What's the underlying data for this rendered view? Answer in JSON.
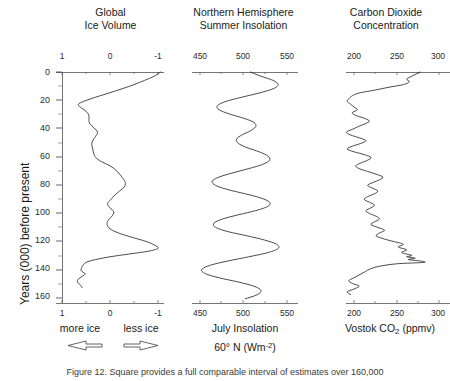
{
  "figure": {
    "caption": "Figure 12. Square provides a full comparable interval of estimates over 160,000"
  },
  "yaxis": {
    "label": "Years (000) before present",
    "ticks": [
      "0",
      "20",
      "40",
      "60",
      "80",
      "100",
      "120",
      "140",
      "160"
    ],
    "min": 0,
    "max": 165,
    "inverted": true
  },
  "panels": [
    {
      "id": "ice-volume",
      "title_line1": "Global",
      "title_line2": "Ice Volume",
      "ticks": [
        "1",
        "0",
        "-1"
      ],
      "tick_values": [
        1,
        0,
        -1
      ],
      "xmin": 1.35,
      "xmax": -1.35,
      "caption_left": "more ice",
      "caption_right": "less ice",
      "arrow_left": "arrow-left",
      "arrow_right": "arrow-right"
    },
    {
      "id": "insolation",
      "title_line1": "Northern Hemisphere",
      "title_line2": "Summer Insolation",
      "ticks": [
        "450",
        "500",
        "550"
      ],
      "tick_values": [
        450,
        500,
        550
      ],
      "xmin": 428,
      "xmax": 572,
      "caption_line1": "July Insolation",
      "caption_line2_pre": "60° N (Wm",
      "caption_line2_sup": "-2",
      "caption_line2_post": ")"
    },
    {
      "id": "co2",
      "title_line1": "Carbon Dioxide",
      "title_line2": "Concentration",
      "ticks": [
        "200",
        "250",
        "300"
      ],
      "tick_values": [
        200,
        250,
        300
      ],
      "xmin": 179,
      "xmax": 321,
      "caption_pre": "Vostok CO",
      "caption_sub": "2",
      "caption_post": " (ppmv)"
    }
  ],
  "chart_data": {
    "type": "line",
    "layout": "three horizontal panels sharing one inverted vertical time axis",
    "ylabel": "Years (000) before present",
    "ylim": [
      165,
      0
    ],
    "yticks": [
      0,
      20,
      40,
      60,
      80,
      100,
      120,
      140,
      160
    ],
    "grid": false,
    "legend": false,
    "series": [
      {
        "name": "Global Ice Volume",
        "panel": 0,
        "xlabel": "more ice  ←   →  less ice",
        "xlim": [
          1.35,
          -1.35
        ],
        "xticks": [
          1,
          0,
          -1
        ],
        "units": "relative δ18O (per mil)",
        "axis_direction": "reversed (1 at left, -1 at right)",
        "points": [
          {
            "age": 0,
            "value": -1.05
          },
          {
            "age": 3,
            "value": -0.92
          },
          {
            "age": 6,
            "value": -0.72
          },
          {
            "age": 9,
            "value": -0.5
          },
          {
            "age": 12,
            "value": -0.25
          },
          {
            "age": 15,
            "value": 0.02
          },
          {
            "age": 18,
            "value": 0.3
          },
          {
            "age": 21,
            "value": 0.55
          },
          {
            "age": 23,
            "value": 0.66
          },
          {
            "age": 25,
            "value": 0.62
          },
          {
            "age": 28,
            "value": 0.5
          },
          {
            "age": 31,
            "value": 0.44
          },
          {
            "age": 34,
            "value": 0.44
          },
          {
            "age": 37,
            "value": 0.42
          },
          {
            "age": 40,
            "value": 0.33
          },
          {
            "age": 43,
            "value": 0.26
          },
          {
            "age": 46,
            "value": 0.3
          },
          {
            "age": 49,
            "value": 0.36
          },
          {
            "age": 52,
            "value": 0.38
          },
          {
            "age": 55,
            "value": 0.36
          },
          {
            "age": 58,
            "value": 0.34
          },
          {
            "age": 61,
            "value": 0.3
          },
          {
            "age": 64,
            "value": 0.18
          },
          {
            "age": 67,
            "value": 0.0
          },
          {
            "age": 70,
            "value": -0.12
          },
          {
            "age": 73,
            "value": -0.2
          },
          {
            "age": 76,
            "value": -0.27
          },
          {
            "age": 79,
            "value": -0.32
          },
          {
            "age": 82,
            "value": -0.3
          },
          {
            "age": 85,
            "value": -0.2
          },
          {
            "age": 88,
            "value": -0.1
          },
          {
            "age": 91,
            "value": -0.02
          },
          {
            "age": 94,
            "value": 0.05
          },
          {
            "age": 97,
            "value": 0.0
          },
          {
            "age": 100,
            "value": -0.08
          },
          {
            "age": 103,
            "value": -0.04
          },
          {
            "age": 106,
            "value": 0.04
          },
          {
            "age": 109,
            "value": 0.06
          },
          {
            "age": 112,
            "value": 0.0
          },
          {
            "age": 115,
            "value": -0.18
          },
          {
            "age": 118,
            "value": -0.45
          },
          {
            "age": 121,
            "value": -0.75
          },
          {
            "age": 124,
            "value": -0.95
          },
          {
            "age": 126,
            "value": -1.0
          },
          {
            "age": 128,
            "value": -0.8
          },
          {
            "age": 130,
            "value": -0.4
          },
          {
            "age": 132,
            "value": 0.0
          },
          {
            "age": 134,
            "value": 0.3
          },
          {
            "age": 136,
            "value": 0.5
          },
          {
            "age": 139,
            "value": 0.58
          },
          {
            "age": 142,
            "value": 0.6
          },
          {
            "age": 144,
            "value": 0.52
          },
          {
            "age": 146,
            "value": 0.58
          },
          {
            "age": 148,
            "value": 0.66
          },
          {
            "age": 150,
            "value": 0.68
          },
          {
            "age": 152,
            "value": 0.62
          },
          {
            "age": 154,
            "value": 0.58
          }
        ]
      },
      {
        "name": "July Insolation 60° N",
        "panel": 1,
        "xlabel": "July Insolation 60° N (Wm-2)",
        "xlim": [
          428,
          572
        ],
        "xticks": [
          450,
          500,
          550
        ],
        "units": "Wm-2",
        "points": [
          {
            "age": 0,
            "value": 508
          },
          {
            "age": 3,
            "value": 520
          },
          {
            "age": 6,
            "value": 534
          },
          {
            "age": 9,
            "value": 540
          },
          {
            "age": 12,
            "value": 534
          },
          {
            "age": 15,
            "value": 518
          },
          {
            "age": 18,
            "value": 498
          },
          {
            "age": 21,
            "value": 480
          },
          {
            "age": 24,
            "value": 470
          },
          {
            "age": 27,
            "value": 472
          },
          {
            "age": 30,
            "value": 484
          },
          {
            "age": 33,
            "value": 500
          },
          {
            "age": 36,
            "value": 512
          },
          {
            "age": 39,
            "value": 514
          },
          {
            "age": 42,
            "value": 508
          },
          {
            "age": 45,
            "value": 498
          },
          {
            "age": 48,
            "value": 492
          },
          {
            "age": 51,
            "value": 494
          },
          {
            "age": 54,
            "value": 504
          },
          {
            "age": 57,
            "value": 518
          },
          {
            "age": 60,
            "value": 528
          },
          {
            "age": 63,
            "value": 530
          },
          {
            "age": 66,
            "value": 522
          },
          {
            "age": 69,
            "value": 506
          },
          {
            "age": 72,
            "value": 488
          },
          {
            "age": 75,
            "value": 472
          },
          {
            "age": 78,
            "value": 464
          },
          {
            "age": 81,
            "value": 468
          },
          {
            "age": 84,
            "value": 482
          },
          {
            "age": 87,
            "value": 502
          },
          {
            "age": 90,
            "value": 520
          },
          {
            "age": 93,
            "value": 530
          },
          {
            "age": 96,
            "value": 528
          },
          {
            "age": 99,
            "value": 514
          },
          {
            "age": 102,
            "value": 494
          },
          {
            "age": 105,
            "value": 476
          },
          {
            "age": 108,
            "value": 466
          },
          {
            "age": 111,
            "value": 468
          },
          {
            "age": 114,
            "value": 482
          },
          {
            "age": 117,
            "value": 504
          },
          {
            "age": 120,
            "value": 524
          },
          {
            "age": 123,
            "value": 538
          },
          {
            "age": 126,
            "value": 540
          },
          {
            "age": 129,
            "value": 528
          },
          {
            "age": 132,
            "value": 506
          },
          {
            "age": 135,
            "value": 482
          },
          {
            "age": 138,
            "value": 462
          },
          {
            "age": 141,
            "value": 452
          },
          {
            "age": 144,
            "value": 456
          },
          {
            "age": 147,
            "value": 472
          },
          {
            "age": 150,
            "value": 494
          },
          {
            "age": 153,
            "value": 512
          },
          {
            "age": 156,
            "value": 520
          },
          {
            "age": 159,
            "value": 516
          },
          {
            "age": 162,
            "value": 502
          }
        ]
      },
      {
        "name": "Vostok CO2",
        "panel": 2,
        "xlabel": "Vostok CO2 (ppmv)",
        "xlim": [
          179,
          321
        ],
        "xticks": [
          200,
          250,
          300
        ],
        "units": "ppmv",
        "points": [
          {
            "age": 0,
            "value": 278
          },
          {
            "age": 3,
            "value": 268
          },
          {
            "age": 5,
            "value": 262
          },
          {
            "age": 7,
            "value": 265
          },
          {
            "age": 9,
            "value": 258
          },
          {
            "age": 11,
            "value": 240
          },
          {
            "age": 13,
            "value": 224
          },
          {
            "age": 15,
            "value": 206
          },
          {
            "age": 17,
            "value": 198
          },
          {
            "age": 19,
            "value": 194
          },
          {
            "age": 21,
            "value": 192
          },
          {
            "age": 23,
            "value": 196
          },
          {
            "age": 25,
            "value": 200
          },
          {
            "age": 27,
            "value": 204
          },
          {
            "age": 29,
            "value": 198
          },
          {
            "age": 31,
            "value": 202
          },
          {
            "age": 33,
            "value": 212
          },
          {
            "age": 35,
            "value": 218
          },
          {
            "age": 37,
            "value": 213
          },
          {
            "age": 39,
            "value": 205
          },
          {
            "age": 41,
            "value": 198
          },
          {
            "age": 43,
            "value": 191
          },
          {
            "age": 45,
            "value": 196
          },
          {
            "age": 47,
            "value": 206
          },
          {
            "age": 49,
            "value": 214
          },
          {
            "age": 51,
            "value": 208
          },
          {
            "age": 53,
            "value": 198
          },
          {
            "age": 55,
            "value": 192
          },
          {
            "age": 57,
            "value": 200
          },
          {
            "age": 59,
            "value": 212
          },
          {
            "age": 61,
            "value": 220
          },
          {
            "age": 63,
            "value": 216
          },
          {
            "age": 65,
            "value": 208
          },
          {
            "age": 67,
            "value": 202
          },
          {
            "age": 69,
            "value": 206
          },
          {
            "age": 71,
            "value": 216
          },
          {
            "age": 73,
            "value": 226
          },
          {
            "age": 75,
            "value": 234
          },
          {
            "age": 77,
            "value": 230
          },
          {
            "age": 79,
            "value": 222
          },
          {
            "age": 81,
            "value": 216
          },
          {
            "age": 83,
            "value": 222
          },
          {
            "age": 85,
            "value": 228
          },
          {
            "age": 87,
            "value": 224
          },
          {
            "age": 89,
            "value": 216
          },
          {
            "age": 91,
            "value": 212
          },
          {
            "age": 93,
            "value": 218
          },
          {
            "age": 95,
            "value": 224
          },
          {
            "age": 97,
            "value": 220
          },
          {
            "age": 99,
            "value": 214
          },
          {
            "age": 101,
            "value": 218
          },
          {
            "age": 103,
            "value": 226
          },
          {
            "age": 105,
            "value": 230
          },
          {
            "age": 107,
            "value": 224
          },
          {
            "age": 109,
            "value": 220
          },
          {
            "age": 111,
            "value": 228
          },
          {
            "age": 113,
            "value": 236
          },
          {
            "age": 115,
            "value": 230
          },
          {
            "age": 117,
            "value": 226
          },
          {
            "age": 119,
            "value": 234
          },
          {
            "age": 121,
            "value": 246
          },
          {
            "age": 123,
            "value": 258
          },
          {
            "age": 125,
            "value": 252
          },
          {
            "age": 127,
            "value": 262
          },
          {
            "age": 129,
            "value": 256
          },
          {
            "age": 131,
            "value": 268
          },
          {
            "age": 132,
            "value": 262
          },
          {
            "age": 133,
            "value": 272
          },
          {
            "age": 134,
            "value": 264
          },
          {
            "age": 135,
            "value": 278
          },
          {
            "age": 136,
            "value": 282
          },
          {
            "age": 137,
            "value": 250
          },
          {
            "age": 139,
            "value": 228
          },
          {
            "age": 141,
            "value": 218
          },
          {
            "age": 143,
            "value": 212
          },
          {
            "age": 145,
            "value": 206
          },
          {
            "age": 147,
            "value": 200
          },
          {
            "age": 149,
            "value": 194
          },
          {
            "age": 151,
            "value": 198
          },
          {
            "age": 153,
            "value": 206
          },
          {
            "age": 155,
            "value": 200
          },
          {
            "age": 157,
            "value": 192
          },
          {
            "age": 159,
            "value": 196
          }
        ]
      }
    ]
  }
}
